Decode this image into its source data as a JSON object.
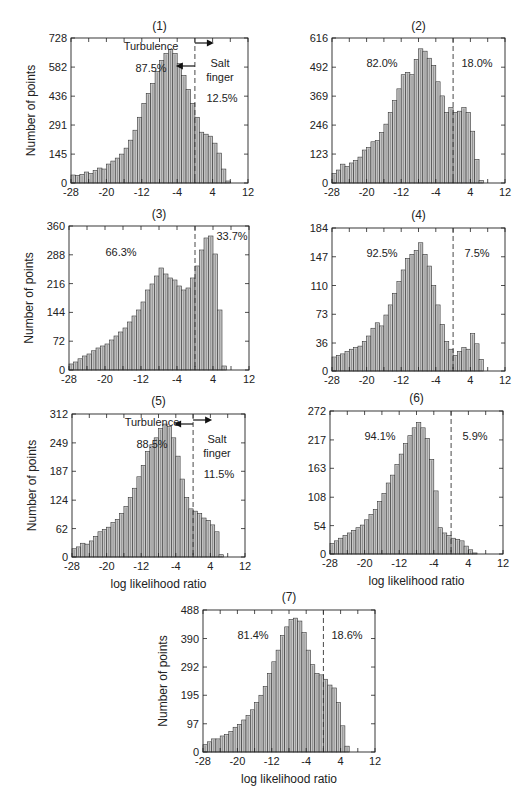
{
  "figure": {
    "xlabel": "log likelihood ratio",
    "ylabel": "Number of points"
  },
  "chart_data": [
    {
      "type": "bar",
      "panel": "(1)",
      "title": "(1)",
      "xlabel": "",
      "ylabel": "Number of points",
      "xlim": [
        -28,
        12
      ],
      "ylim": [
        0,
        728
      ],
      "xticks": [
        -28,
        -20,
        -12,
        -4,
        4,
        12
      ],
      "yticks": [
        0,
        145,
        291,
        436,
        582,
        728
      ],
      "threshold_x": 0,
      "annotations": [
        "Turbulence",
        "87.5%",
        "Salt",
        "finger",
        "12.5%"
      ],
      "left_pct": "87.5%",
      "right_pct": "12.5%",
      "bin_start": -28,
      "bin_width": 1,
      "values": [
        40,
        38,
        42,
        55,
        48,
        62,
        75,
        70,
        95,
        110,
        125,
        145,
        175,
        215,
        265,
        330,
        400,
        450,
        500,
        560,
        615,
        650,
        670,
        650,
        600,
        540,
        470,
        400,
        330,
        255,
        245,
        235,
        200,
        150,
        70,
        10
      ]
    },
    {
      "type": "bar",
      "panel": "(2)",
      "title": "(2)",
      "xlabel": "",
      "ylabel": "",
      "xlim": [
        -28,
        12
      ],
      "ylim": [
        0,
        616
      ],
      "xticks": [
        -28,
        -20,
        -12,
        -4,
        4,
        12
      ],
      "yticks": [
        0,
        123,
        246,
        369,
        492,
        616
      ],
      "threshold_x": 0,
      "annotations": [
        "82.0%",
        "18.0%"
      ],
      "left_pct": "82.0%",
      "right_pct": "18.0%",
      "bin_start": -28,
      "bin_width": 1,
      "values": [
        40,
        55,
        80,
        70,
        85,
        95,
        110,
        140,
        150,
        175,
        180,
        215,
        250,
        300,
        350,
        400,
        460,
        470,
        460,
        525,
        570,
        560,
        530,
        500,
        430,
        370,
        300,
        320,
        300,
        305,
        320,
        300,
        220,
        100,
        10,
        0
      ]
    },
    {
      "type": "bar",
      "panel": "(3)",
      "title": "(3)",
      "xlabel": "",
      "ylabel": "Number of points",
      "xlim": [
        -28,
        12
      ],
      "ylim": [
        0,
        360
      ],
      "xticks": [
        -28,
        -20,
        -12,
        -4,
        4,
        12
      ],
      "yticks": [
        0,
        72,
        144,
        216,
        288,
        360
      ],
      "threshold_x": 0,
      "annotations": [
        "66.3%",
        "33.7%"
      ],
      "left_pct": "66.3%",
      "right_pct": "33.7%",
      "bin_start": -28,
      "bin_width": 1,
      "values": [
        15,
        20,
        28,
        35,
        40,
        48,
        55,
        60,
        65,
        75,
        85,
        95,
        105,
        120,
        135,
        150,
        170,
        200,
        215,
        235,
        255,
        240,
        230,
        225,
        210,
        200,
        205,
        230,
        260,
        300,
        330,
        335,
        290,
        150,
        10,
        0
      ]
    },
    {
      "type": "bar",
      "panel": "(4)",
      "title": "(4)",
      "xlabel": "",
      "ylabel": "",
      "xlim": [
        -28,
        12
      ],
      "ylim": [
        0,
        184
      ],
      "xticks": [
        -28,
        -20,
        -12,
        -4,
        4,
        12
      ],
      "yticks": [
        0,
        36,
        73,
        110,
        147,
        184
      ],
      "threshold_x": 0,
      "annotations": [
        "92.5%",
        "7.5%"
      ],
      "left_pct": "92.5%",
      "right_pct": "7.5%",
      "bin_start": -28,
      "bin_width": 1,
      "values": [
        18,
        20,
        22,
        25,
        28,
        30,
        32,
        38,
        45,
        55,
        62,
        58,
        72,
        85,
        100,
        115,
        130,
        145,
        150,
        155,
        165,
        150,
        135,
        110,
        85,
        60,
        38,
        28,
        20,
        25,
        30,
        28,
        48,
        35,
        15,
        0
      ]
    },
    {
      "type": "bar",
      "panel": "(5)",
      "title": "(5)",
      "xlabel": "log likelihood ratio",
      "ylabel": "Number of points",
      "xlim": [
        -28,
        12
      ],
      "ylim": [
        0,
        312
      ],
      "xticks": [
        -28,
        -20,
        -12,
        -4,
        4,
        12
      ],
      "yticks": [
        0,
        62,
        124,
        187,
        249,
        312
      ],
      "threshold_x": 0,
      "annotations": [
        "Turbulence",
        "88.5%",
        "Salt",
        "finger",
        "11.5%"
      ],
      "left_pct": "88.5%",
      "right_pct": "11.5%",
      "bin_start": -28,
      "bin_width": 1,
      "values": [
        18,
        22,
        30,
        28,
        35,
        45,
        55,
        60,
        65,
        75,
        82,
        95,
        110,
        130,
        150,
        175,
        200,
        230,
        245,
        260,
        280,
        290,
        285,
        260,
        220,
        170,
        130,
        105,
        100,
        95,
        85,
        80,
        70,
        55,
        5,
        0
      ]
    },
    {
      "type": "bar",
      "panel": "(6)",
      "title": "(6)",
      "xlabel": "log likelihood ratio",
      "ylabel": "",
      "xlim": [
        -28,
        12
      ],
      "ylim": [
        0,
        272
      ],
      "xticks": [
        -28,
        -20,
        -12,
        -4,
        4,
        12
      ],
      "yticks": [
        0,
        54,
        108,
        163,
        217,
        272
      ],
      "threshold_x": 0,
      "annotations": [
        "94.1%",
        "5.9%"
      ],
      "left_pct": "94.1%",
      "right_pct": "5.9%",
      "bin_start": -28,
      "bin_width": 1,
      "values": [
        20,
        25,
        30,
        35,
        40,
        45,
        50,
        55,
        65,
        75,
        85,
        100,
        115,
        135,
        150,
        170,
        190,
        210,
        225,
        240,
        250,
        240,
        220,
        180,
        120,
        50,
        40,
        35,
        30,
        28,
        25,
        15,
        8,
        2,
        0,
        0
      ]
    },
    {
      "type": "bar",
      "panel": "(7)",
      "title": "(7)",
      "xlabel": "log likelihood ratio",
      "ylabel": "Number of points",
      "xlim": [
        -28,
        12
      ],
      "ylim": [
        0,
        488
      ],
      "xticks": [
        -28,
        -20,
        -12,
        -4,
        4,
        12
      ],
      "yticks": [
        0,
        97,
        195,
        292,
        390,
        488
      ],
      "threshold_x": 0,
      "annotations": [
        "81.4%",
        "18.6%"
      ],
      "left_pct": "81.4%",
      "right_pct": "18.6%",
      "bin_start": -28,
      "bin_width": 1,
      "values": [
        25,
        35,
        45,
        45,
        55,
        60,
        70,
        85,
        95,
        110,
        125,
        145,
        170,
        195,
        225,
        270,
        310,
        350,
        400,
        430,
        455,
        460,
        450,
        410,
        350,
        300,
        270,
        265,
        250,
        230,
        220,
        170,
        90,
        20,
        0,
        0
      ]
    }
  ],
  "panels_layout": [
    {
      "x0": 71,
      "x1": 248,
      "y0": 38,
      "y1": 183,
      "title_y": 30,
      "ylabel": true,
      "xlabel": false
    },
    {
      "x0": 332,
      "x1": 505,
      "y0": 38,
      "y1": 183,
      "title_y": 30,
      "ylabel": false,
      "xlabel": false
    },
    {
      "x0": 69,
      "x1": 249,
      "y0": 226,
      "y1": 370,
      "title_y": 218,
      "ylabel": true,
      "xlabel": false
    },
    {
      "x0": 332,
      "x1": 505,
      "y0": 228,
      "y1": 371,
      "title_y": 219,
      "ylabel": false,
      "xlabel": false
    },
    {
      "x0": 72,
      "x1": 245,
      "y0": 414,
      "y1": 557,
      "title_y": 405,
      "ylabel": true,
      "xlabel": true
    },
    {
      "x0": 330,
      "x1": 503,
      "y0": 411,
      "y1": 554,
      "title_y": 402,
      "ylabel": false,
      "xlabel": true
    },
    {
      "x0": 203,
      "x1": 375,
      "y0": 610,
      "y1": 752,
      "title_y": 601,
      "ylabel": true,
      "xlabel": true
    }
  ]
}
